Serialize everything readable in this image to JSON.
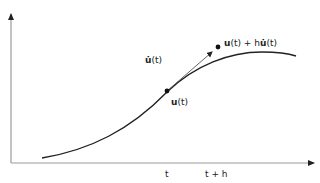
{
  "diagram": {
    "title": "",
    "colors": {
      "axis": "#9a9a9a",
      "curve": "#222222",
      "tangent": "#555555",
      "point": "#111111",
      "text": "#222222"
    },
    "axes": {
      "x_tick_labels": [
        {
          "id": "t",
          "text": "t"
        },
        {
          "id": "t_plus_h",
          "text": "t + h"
        }
      ]
    },
    "points": [
      {
        "id": "u_t",
        "label_bold": "u",
        "label_rest": "(t)"
      },
      {
        "id": "euler_step",
        "label_bold": "u",
        "label_mid": "(t) + h",
        "label_bold2": "u̇",
        "label_rest": "(t)"
      }
    ],
    "tangent": {
      "label_bold": "u̇",
      "label_rest": "(t)"
    }
  }
}
